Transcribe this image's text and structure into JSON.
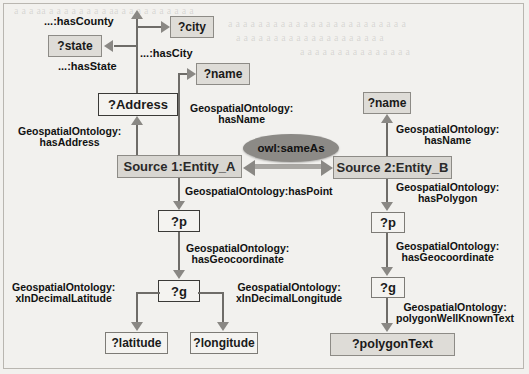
{
  "figure": {
    "type": "rdf-graph-diagram",
    "background_color": "#f2f1ee",
    "line_color": "#6e6c68",
    "shaded_node_color": "#dedcd7",
    "source_node_color": "#d8d6d1",
    "ellipse_color": "#8c8a86"
  },
  "nodes": {
    "city": "?city",
    "state": "?state",
    "name_left": "?name",
    "address": "?Address",
    "source1": "Source 1:Entity_A",
    "source2": "Source 2:Entity_B",
    "name_right": "?name",
    "p_left": "?p",
    "g_left": "?g",
    "latitude": "?latitude",
    "longitude": "?longitude",
    "p_right": "?p",
    "g_right": "?g",
    "polygon_text": "?polygonText"
  },
  "edges": {
    "has_county": "...:hasCounty",
    "has_city": "...:hasCity",
    "has_state": "...:hasState",
    "has_address_l1": "GeospatialOntology:",
    "has_address_l2": "hasAddress",
    "has_name_left_l1": "GeospatialOntology:",
    "has_name_left_l2": "hasName",
    "same_as": "owl:sameAs",
    "has_name_right_l1": "GeospatialOntology:",
    "has_name_right_l2": "hasName",
    "has_point": "GeospatialOntology:hasPoint",
    "has_polygon_l1": "GeospatialOntology:",
    "has_polygon_l2": "hasPolygon",
    "has_geocoordinate_left_l1": "GeospatialOntology:",
    "has_geocoordinate_left_l2": "hasGeocoordinate",
    "has_geocoordinate_right_l1": "GeospatialOntology:",
    "has_geocoordinate_right_l2": "hasGeocoordinate",
    "x_in_decimal_latitude_l1": "GeospatialOntology:",
    "x_in_decimal_latitude_l2": "xInDecimalLatitude",
    "x_in_decimal_longitude_l1": "GeospatialOntology:",
    "x_in_decimal_longitude_l2": "xInDecimalLongitude",
    "polygon_wkt_l1": "GeospatialOntology:",
    "polygon_wkt_l2": "polygonWellKnownText"
  },
  "background_bleed": {
    "line1": "a a a aa a a a a a a a a aa a a a a a a a a a a",
    "line2": "a a a a a a a a a a a a a a a a a a a a a a a a",
    "line3": "a a a a a a a a a a a a a a a a a a a a",
    "line4": "a a a a a a a a a a a a a a a"
  }
}
